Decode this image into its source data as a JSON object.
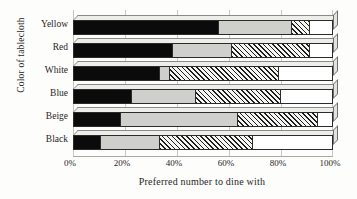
{
  "chart_data": {
    "type": "bar",
    "orientation": "horizontal",
    "stacked": true,
    "percent_stacked": true,
    "title": "",
    "xlabel": "Preferred number to dine with",
    "ylabel": "Color of tablecloth",
    "xlim": [
      0,
      100
    ],
    "xticks": [
      0,
      20,
      40,
      60,
      80,
      100
    ],
    "xticklabels": [
      "0%",
      "20%",
      "40%",
      "60%",
      "80%",
      "100%"
    ],
    "grid": true,
    "legend": "none",
    "categories": [
      "Yellow",
      "Red",
      "White",
      "Blue",
      "Beige",
      "Black"
    ],
    "categories_top_to_bottom": [
      "Yellow",
      "Red",
      "White",
      "Blue",
      "Beige",
      "Black"
    ],
    "series": [
      {
        "name": "series-1",
        "fill": "solid-black",
        "values": [
          56,
          38,
          33,
          22,
          18,
          10
        ]
      },
      {
        "name": "series-2",
        "fill": "light-gray",
        "values": [
          28,
          23,
          4,
          25,
          45,
          23
        ]
      },
      {
        "name": "series-3",
        "fill": "diagonal-hatch",
        "values": [
          7,
          30,
          42,
          33,
          31,
          36
        ]
      },
      {
        "name": "series-4",
        "fill": "white",
        "values": [
          9,
          9,
          21,
          20,
          6,
          31
        ]
      }
    ],
    "cumulative_boundaries": {
      "Yellow": [
        56,
        84,
        91,
        100
      ],
      "Red": [
        38,
        61,
        91,
        100
      ],
      "White": [
        33,
        37,
        79,
        100
      ],
      "Blue": [
        22,
        47,
        80,
        100
      ],
      "Beige": [
        18,
        63,
        94,
        100
      ],
      "Black": [
        10,
        33,
        69,
        100
      ]
    },
    "colors": {
      "series-1": "#0b0b0b",
      "series-2": "#cfcfcb",
      "series-3": "#1d1d1d",
      "series-4": "#ffffff",
      "axis": "#262626",
      "grid": "#c9c7c2",
      "background": "#fdfdfb"
    }
  }
}
